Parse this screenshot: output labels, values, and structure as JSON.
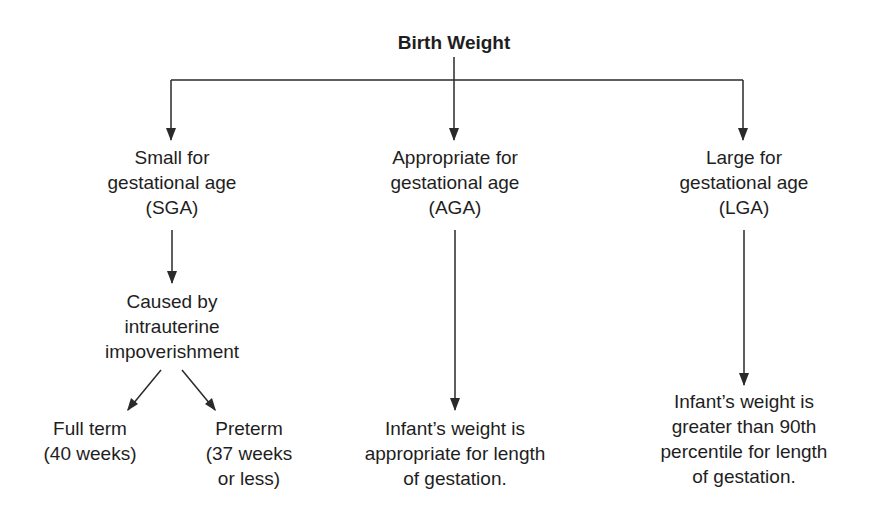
{
  "diagram": {
    "root": {
      "lines": [
        "Birth Weight"
      ]
    },
    "categories": [
      {
        "id": "sga",
        "lines": [
          "Small for",
          "gestational age",
          "(SGA)"
        ]
      },
      {
        "id": "aga",
        "lines": [
          "Appropriate for",
          "gestational age",
          "(AGA)"
        ]
      },
      {
        "id": "lga",
        "lines": [
          "Large for",
          "gestational age",
          "(LGA)"
        ]
      }
    ],
    "sga_cause": {
      "lines": [
        "Caused by",
        "intrauterine",
        "impoverishment"
      ]
    },
    "sga_outcomes": [
      {
        "id": "full-term",
        "lines": [
          "Full term",
          "(40 weeks)"
        ]
      },
      {
        "id": "preterm",
        "lines": [
          "Preterm",
          "(37 weeks",
          "or less)"
        ]
      }
    ],
    "aga_result": {
      "lines": [
        "Infant’s weight is",
        "appropriate for length",
        "of gestation."
      ]
    },
    "lga_result": {
      "lines": [
        "Infant’s weight is",
        "greater than 90th",
        "percentile for length",
        "of gestation."
      ]
    },
    "colors": {
      "line": "#2a2a2a",
      "text": "#1e1e1e",
      "background": "#ffffff"
    }
  }
}
